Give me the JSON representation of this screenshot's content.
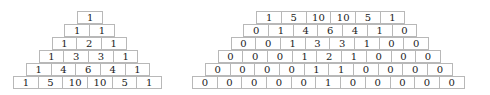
{
  "left_pyramid": {
    "rows": [
      [
        "1"
      ],
      [
        "1",
        "1"
      ],
      [
        "1",
        "2",
        "1"
      ],
      [
        "1",
        "3",
        "3",
        "1"
      ],
      [
        "1",
        "4",
        "6",
        "4",
        "1"
      ],
      [
        "1",
        "5",
        "10",
        "10",
        "5",
        "1"
      ]
    ]
  },
  "right_pyramid": {
    "rows": [
      [
        "1",
        "5",
        "10",
        "10",
        "5",
        "1"
      ],
      [
        "0",
        "1",
        "4",
        "6",
        "4",
        "1",
        "0"
      ],
      [
        "0",
        "0",
        "1",
        "3",
        "3",
        "1",
        "0",
        "0"
      ],
      [
        "0",
        "0",
        "0",
        "1",
        "2",
        "1",
        "0",
        "0",
        "0"
      ],
      [
        "0",
        "0",
        "0",
        "0",
        "1",
        "1",
        "0",
        "0",
        "0",
        "0"
      ],
      [
        "0",
        "0",
        "0",
        "0",
        "0",
        "1",
        "0",
        "0",
        "0",
        "0",
        "0"
      ]
    ]
  }
}
